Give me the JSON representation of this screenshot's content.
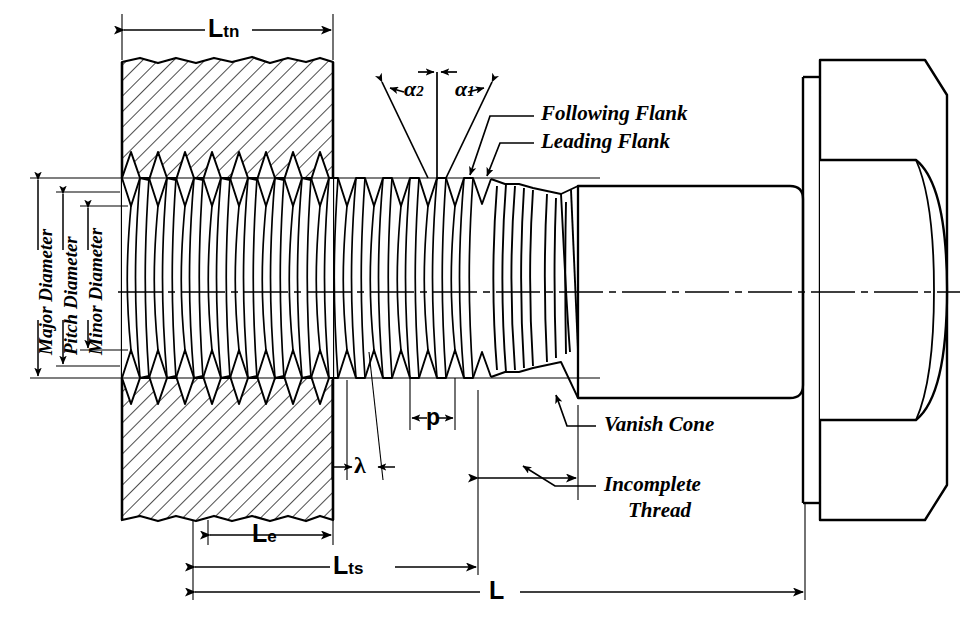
{
  "diagram": {
    "type": "engineering-line-drawing",
    "stroke_color": "#000000",
    "background_color": "#ffffff"
  },
  "dimensions": {
    "length_of_thread_nut": "L",
    "length_of_thread_nut_sub": "tn",
    "length_of_engagement": "L",
    "length_of_engagement_sub": "e",
    "length_of_thread_screw": "L",
    "length_of_thread_screw_sub": "ts",
    "overall_length": "L",
    "pitch": "p",
    "lead_angle": "λ"
  },
  "angles": {
    "following_flank_angle": "α",
    "following_flank_angle_sub": "2",
    "leading_flank_angle": "α",
    "leading_flank_angle_sub": "1"
  },
  "diameters": [
    {
      "label": "Major Diameter"
    },
    {
      "label": "Pitch Diameter"
    },
    {
      "label": "Minor Diameter"
    }
  ],
  "callouts": [
    {
      "label": "Following Flank"
    },
    {
      "label": "Leading Flank"
    },
    {
      "label": "Vanish Cone"
    },
    {
      "label": "Incomplete",
      "label2": "Thread"
    }
  ],
  "parts": {
    "nut": "hatched-nut-section",
    "bolt": "hex-head-bolt",
    "thread": "helical-thread-profile",
    "centerline": "axis-centerline"
  }
}
